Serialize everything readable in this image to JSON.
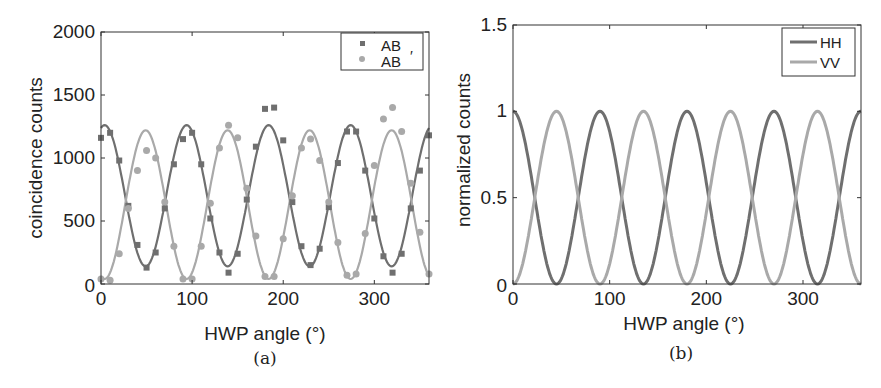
{
  "chart_data": [
    {
      "id": "a",
      "type": "scatter",
      "caption": "(a)",
      "title": "",
      "xlabel": "HWP angle (°)",
      "ylabel": "coincidence counts",
      "xlim": [
        0,
        360
      ],
      "ylim": [
        0,
        2000
      ],
      "xticks": [
        0,
        100,
        200,
        300
      ],
      "yticks": [
        0,
        500,
        1000,
        1500,
        2000
      ],
      "grid": false,
      "legend_position": "top-right",
      "legend": [
        {
          "label": "AB",
          "marker": "square",
          "color": "#6f6f6f"
        },
        {
          "label": "AB",
          "marker": "circle",
          "color": "#a9a9a9",
          "annotation": "′"
        }
      ],
      "series": [
        {
          "name": "AB",
          "marker": "square",
          "color": "#6f6f6f",
          "x": [
            0,
            10,
            20,
            30,
            40,
            50,
            60,
            70,
            80,
            90,
            100,
            110,
            120,
            130,
            140,
            150,
            160,
            170,
            180,
            190,
            200,
            210,
            220,
            230,
            240,
            250,
            260,
            270,
            280,
            290,
            300,
            310,
            320,
            330,
            340,
            350,
            360
          ],
          "y": [
            1160,
            1200,
            980,
            620,
            310,
            130,
            250,
            600,
            950,
            1150,
            1200,
            950,
            520,
            250,
            90,
            240,
            670,
            1090,
            1390,
            1400,
            1140,
            650,
            300,
            150,
            280,
            610,
            960,
            1210,
            1210,
            900,
            520,
            220,
            90,
            240,
            600,
            900,
            1180
          ]
        },
        {
          "name": "AB′",
          "marker": "circle",
          "color": "#a9a9a9",
          "x": [
            0,
            10,
            20,
            30,
            40,
            50,
            60,
            70,
            80,
            90,
            100,
            110,
            120,
            130,
            140,
            150,
            160,
            170,
            180,
            190,
            200,
            210,
            220,
            230,
            240,
            250,
            260,
            270,
            280,
            290,
            300,
            310,
            320,
            330,
            340,
            350,
            360
          ],
          "y": [
            40,
            30,
            240,
            600,
            900,
            1060,
            1000,
            650,
            300,
            40,
            40,
            300,
            640,
            1080,
            1260,
            1160,
            760,
            380,
            60,
            60,
            360,
            700,
            1080,
            1150,
            980,
            650,
            330,
            70,
            80,
            400,
            940,
            1310,
            1400,
            1210,
            800,
            410,
            80
          ]
        }
      ],
      "fits": [
        {
          "name": "AB fit",
          "color": "#6f6f6f",
          "model": "offset + amp*cos(4*(x - phase))",
          "offset": 700,
          "amp": 560,
          "phase_deg": 4
        },
        {
          "name": "AB′ fit",
          "color": "#a9a9a9",
          "model": "offset + amp*cos(4*(x - phase))",
          "offset": 630,
          "amp": 590,
          "phase_deg": 49
        }
      ]
    },
    {
      "id": "b",
      "type": "line",
      "caption": "(b)",
      "title": "",
      "xlabel": "HWP angle (°)",
      "ylabel": "normalized counts",
      "xlim": [
        0,
        360
      ],
      "ylim": [
        0,
        1.5
      ],
      "xticks": [
        0,
        100,
        200,
        300
      ],
      "yticks": [
        0,
        0.5,
        1,
        1.5
      ],
      "ytick_labels": [
        "0",
        "0.5",
        "1",
        "1.5"
      ],
      "grid": false,
      "legend_position": "top-right",
      "legend": [
        {
          "label": "HH",
          "marker": "line",
          "color": "#6f6f6f"
        },
        {
          "label": "VV",
          "marker": "line",
          "color": "#a9a9a9"
        }
      ],
      "series": [
        {
          "name": "HH",
          "color": "#6f6f6f",
          "model": "cos^2(2x)",
          "x": [
            0,
            22.5,
            45,
            67.5,
            90,
            112.5,
            135,
            157.5,
            180,
            202.5,
            225,
            247.5,
            270,
            292.5,
            315,
            337.5,
            360
          ],
          "values": [
            1,
            0.5,
            0,
            0.5,
            1,
            0.5,
            0,
            0.5,
            1,
            0.5,
            0,
            0.5,
            1,
            0.5,
            0,
            0.5,
            1
          ]
        },
        {
          "name": "VV",
          "color": "#a9a9a9",
          "model": "sin^2(2x)",
          "x": [
            0,
            22.5,
            45,
            67.5,
            90,
            112.5,
            135,
            157.5,
            180,
            202.5,
            225,
            247.5,
            270,
            292.5,
            315,
            337.5,
            360
          ],
          "values": [
            0,
            0.5,
            1,
            0.5,
            0,
            0.5,
            1,
            0.5,
            0,
            0.5,
            1,
            0.5,
            0,
            0.5,
            1,
            0.5,
            0
          ]
        }
      ]
    }
  ]
}
